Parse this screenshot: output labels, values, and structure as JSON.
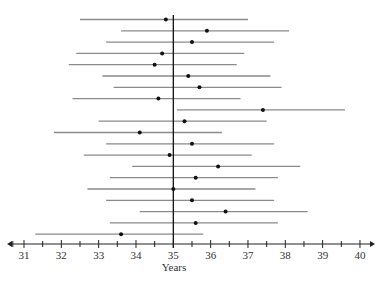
{
  "chart_data": {
    "type": "interval",
    "title": "",
    "xlabel": "Years",
    "ylabel": "",
    "xlim": [
      31,
      40
    ],
    "x_ticks": [
      31,
      32,
      33,
      34,
      35,
      36,
      37,
      38,
      39,
      40
    ],
    "x_minor_tick_step": 0.5,
    "reference_line": 35,
    "grid": false,
    "legend": null,
    "intervals": [
      {
        "lower": 32.5,
        "estimate": 34.8,
        "upper": 37.0
      },
      {
        "lower": 33.6,
        "estimate": 35.9,
        "upper": 38.1
      },
      {
        "lower": 33.2,
        "estimate": 35.5,
        "upper": 37.7
      },
      {
        "lower": 32.4,
        "estimate": 34.7,
        "upper": 36.9
      },
      {
        "lower": 32.2,
        "estimate": 34.5,
        "upper": 36.7
      },
      {
        "lower": 33.1,
        "estimate": 35.4,
        "upper": 37.6
      },
      {
        "lower": 33.4,
        "estimate": 35.7,
        "upper": 37.9
      },
      {
        "lower": 32.3,
        "estimate": 34.6,
        "upper": 36.8
      },
      {
        "lower": 35.1,
        "estimate": 37.4,
        "upper": 39.6
      },
      {
        "lower": 33.0,
        "estimate": 35.3,
        "upper": 37.5
      },
      {
        "lower": 31.8,
        "estimate": 34.1,
        "upper": 36.3
      },
      {
        "lower": 33.2,
        "estimate": 35.5,
        "upper": 37.7
      },
      {
        "lower": 32.6,
        "estimate": 34.9,
        "upper": 37.1
      },
      {
        "lower": 33.9,
        "estimate": 36.2,
        "upper": 38.4
      },
      {
        "lower": 33.3,
        "estimate": 35.6,
        "upper": 37.8
      },
      {
        "lower": 32.7,
        "estimate": 35.0,
        "upper": 37.2
      },
      {
        "lower": 33.2,
        "estimate": 35.5,
        "upper": 37.7
      },
      {
        "lower": 34.1,
        "estimate": 36.4,
        "upper": 38.6
      },
      {
        "lower": 33.3,
        "estimate": 35.6,
        "upper": 37.8
      },
      {
        "lower": 31.3,
        "estimate": 33.6,
        "upper": 35.8
      }
    ]
  },
  "colors": {
    "interval_line": "#8a8a8a",
    "point": "#111111",
    "axis": "#222222",
    "reference_line": "#111111"
  }
}
